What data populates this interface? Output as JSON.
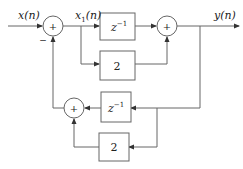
{
  "diagram": {
    "type": "block-diagram",
    "signals": {
      "input": "x(n)",
      "intermediate": "x",
      "intermediate_sub": "1",
      "intermediate_arg": "(n)",
      "output": "y(n)"
    },
    "blocks": {
      "top_delay": {
        "base": "z",
        "exp": "−1"
      },
      "top_gain": "2",
      "bottom_delay": {
        "base": "z",
        "exp": "−1"
      },
      "bottom_gain": "2"
    },
    "summers": {
      "left": {
        "symbol": "+",
        "minus_sign": "−"
      },
      "right": {
        "symbol": "+"
      },
      "bottom": {
        "symbol": "+"
      }
    },
    "colors": {
      "line": "#555555",
      "box": "#666666",
      "text": "#222222"
    }
  }
}
